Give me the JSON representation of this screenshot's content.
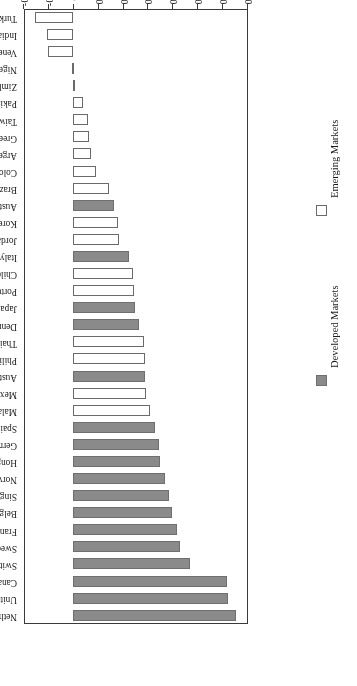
{
  "chart_data": {
    "type": "bar",
    "orientation": "horizontal",
    "rotated_180": true,
    "title": "",
    "xlabel": "Correlation",
    "ylabel": "",
    "xlim": [
      -0.2,
      0.7
    ],
    "grid": false,
    "tick_labels": [
      "0.7",
      "0.6",
      "0.5",
      "0.4",
      "0.3",
      "0.2",
      "0.1",
      "0",
      "-0.1",
      "-0.2"
    ],
    "tick_values": [
      0.7,
      0.6,
      0.5,
      0.4,
      0.3,
      0.2,
      0.1,
      0,
      -0.1,
      -0.2
    ],
    "legend_position": "right",
    "legend": [
      {
        "label": "Developed Markets",
        "color": "#8a8a8a",
        "key": "developed"
      },
      {
        "label": "Emerging Markets",
        "color": "#ffffff",
        "key": "emerging"
      }
    ],
    "categories": [
      "Netherlands",
      "United Kingdom",
      "Canada",
      "Switzerland",
      "Sweden",
      "France",
      "Belgium",
      "Singapore",
      "Norway",
      "Hong Kong",
      "Germany",
      "Spain",
      "Malaysia",
      "Mexico",
      "Australia",
      "Philippines",
      "Thailand",
      "Denmark",
      "Japan",
      "Portugal",
      "Chile",
      "Italy",
      "Jordan",
      "Korea",
      "Austria",
      "Brazil",
      "Colombia",
      "Argentina",
      "Greece",
      "Taiwan",
      "Pakistan",
      "Zimbabwe",
      "Nigeria",
      "Venezuela",
      "India",
      "Turkey"
    ],
    "values": [
      0.655,
      0.625,
      0.62,
      0.47,
      0.43,
      0.42,
      0.4,
      0.385,
      0.37,
      0.35,
      0.345,
      0.33,
      0.31,
      0.295,
      0.29,
      0.29,
      0.285,
      0.265,
      0.25,
      0.245,
      0.24,
      0.225,
      0.185,
      0.18,
      0.165,
      0.145,
      0.095,
      0.075,
      0.065,
      0.06,
      0.04,
      0.01,
      0.003,
      -0.098,
      -0.105,
      -0.15
    ],
    "groups": [
      "developed",
      "developed",
      "developed",
      "developed",
      "developed",
      "developed",
      "developed",
      "developed",
      "developed",
      "developed",
      "developed",
      "developed",
      "emerging",
      "emerging",
      "developed",
      "emerging",
      "emerging",
      "developed",
      "developed",
      "emerging",
      "emerging",
      "developed",
      "emerging",
      "emerging",
      "developed",
      "emerging",
      "emerging",
      "emerging",
      "emerging",
      "emerging",
      "emerging",
      "emerging",
      "emerging",
      "emerging",
      "emerging",
      "emerging"
    ]
  }
}
